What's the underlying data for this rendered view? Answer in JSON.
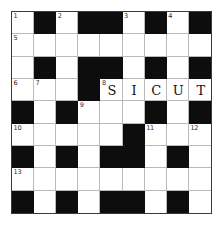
{
  "puzzle": {
    "type": "crossword-grid",
    "rows": 9,
    "columns": 9,
    "block_color": "#0d0d0d",
    "cell_color": "#ffffff",
    "grid_line_color": "#b9b9b9",
    "border_color": "#3a3a3a",
    "number_color": "#2b2b2b",
    "letter_color": "#111111",
    "filled_answer": "SICUT",
    "clue_numbers": [
      1,
      2,
      3,
      4,
      5,
      6,
      7,
      8,
      9,
      10,
      11,
      12,
      13
    ],
    "cells": [
      [
        {
          "block": false,
          "number": "1",
          "letter": ""
        },
        {
          "block": true,
          "number": "",
          "letter": ""
        },
        {
          "block": false,
          "number": "2",
          "letter": ""
        },
        {
          "block": true,
          "number": "",
          "letter": ""
        },
        {
          "block": true,
          "number": "",
          "letter": ""
        },
        {
          "block": false,
          "number": "3",
          "letter": ""
        },
        {
          "block": true,
          "number": "",
          "letter": ""
        },
        {
          "block": false,
          "number": "4",
          "letter": ""
        },
        {
          "block": true,
          "number": "",
          "letter": ""
        }
      ],
      [
        {
          "block": false,
          "number": "5",
          "letter": ""
        },
        {
          "block": false,
          "number": "",
          "letter": ""
        },
        {
          "block": false,
          "number": "",
          "letter": ""
        },
        {
          "block": false,
          "number": "",
          "letter": ""
        },
        {
          "block": false,
          "number": "",
          "letter": ""
        },
        {
          "block": false,
          "number": "",
          "letter": ""
        },
        {
          "block": false,
          "number": "",
          "letter": ""
        },
        {
          "block": false,
          "number": "",
          "letter": ""
        },
        {
          "block": false,
          "number": "",
          "letter": ""
        }
      ],
      [
        {
          "block": false,
          "number": "",
          "letter": ""
        },
        {
          "block": true,
          "number": "",
          "letter": ""
        },
        {
          "block": false,
          "number": "",
          "letter": ""
        },
        {
          "block": true,
          "number": "",
          "letter": ""
        },
        {
          "block": true,
          "number": "",
          "letter": ""
        },
        {
          "block": false,
          "number": "",
          "letter": ""
        },
        {
          "block": true,
          "number": "",
          "letter": ""
        },
        {
          "block": false,
          "number": "",
          "letter": ""
        },
        {
          "block": true,
          "number": "",
          "letter": ""
        }
      ],
      [
        {
          "block": false,
          "number": "6",
          "letter": ""
        },
        {
          "block": false,
          "number": "7",
          "letter": ""
        },
        {
          "block": false,
          "number": "",
          "letter": ""
        },
        {
          "block": true,
          "number": "",
          "letter": ""
        },
        {
          "block": false,
          "number": "8",
          "letter": "S"
        },
        {
          "block": false,
          "number": "",
          "letter": "I"
        },
        {
          "block": false,
          "number": "",
          "letter": "C"
        },
        {
          "block": false,
          "number": "",
          "letter": "U"
        },
        {
          "block": false,
          "number": "",
          "letter": "T"
        }
      ],
      [
        {
          "block": true,
          "number": "",
          "letter": ""
        },
        {
          "block": false,
          "number": "",
          "letter": ""
        },
        {
          "block": true,
          "number": "",
          "letter": ""
        },
        {
          "block": false,
          "number": "9",
          "letter": ""
        },
        {
          "block": false,
          "number": "",
          "letter": ""
        },
        {
          "block": false,
          "number": "",
          "letter": ""
        },
        {
          "block": true,
          "number": "",
          "letter": ""
        },
        {
          "block": false,
          "number": "",
          "letter": ""
        },
        {
          "block": true,
          "number": "",
          "letter": ""
        }
      ],
      [
        {
          "block": false,
          "number": "10",
          "letter": ""
        },
        {
          "block": false,
          "number": "",
          "letter": ""
        },
        {
          "block": false,
          "number": "",
          "letter": ""
        },
        {
          "block": false,
          "number": "",
          "letter": ""
        },
        {
          "block": false,
          "number": "",
          "letter": ""
        },
        {
          "block": true,
          "number": "",
          "letter": ""
        },
        {
          "block": false,
          "number": "11",
          "letter": ""
        },
        {
          "block": false,
          "number": "",
          "letter": ""
        },
        {
          "block": false,
          "number": "12",
          "letter": ""
        }
      ],
      [
        {
          "block": true,
          "number": "",
          "letter": ""
        },
        {
          "block": false,
          "number": "",
          "letter": ""
        },
        {
          "block": true,
          "number": "",
          "letter": ""
        },
        {
          "block": false,
          "number": "",
          "letter": ""
        },
        {
          "block": true,
          "number": "",
          "letter": ""
        },
        {
          "block": true,
          "number": "",
          "letter": ""
        },
        {
          "block": false,
          "number": "",
          "letter": ""
        },
        {
          "block": true,
          "number": "",
          "letter": ""
        },
        {
          "block": false,
          "number": "",
          "letter": ""
        }
      ],
      [
        {
          "block": false,
          "number": "13",
          "letter": ""
        },
        {
          "block": false,
          "number": "",
          "letter": ""
        },
        {
          "block": false,
          "number": "",
          "letter": ""
        },
        {
          "block": false,
          "number": "",
          "letter": ""
        },
        {
          "block": false,
          "number": "",
          "letter": ""
        },
        {
          "block": false,
          "number": "",
          "letter": ""
        },
        {
          "block": false,
          "number": "",
          "letter": ""
        },
        {
          "block": false,
          "number": "",
          "letter": ""
        },
        {
          "block": false,
          "number": "",
          "letter": ""
        }
      ],
      [
        {
          "block": true,
          "number": "",
          "letter": ""
        },
        {
          "block": false,
          "number": "",
          "letter": ""
        },
        {
          "block": true,
          "number": "",
          "letter": ""
        },
        {
          "block": false,
          "number": "",
          "letter": ""
        },
        {
          "block": true,
          "number": "",
          "letter": ""
        },
        {
          "block": true,
          "number": "",
          "letter": ""
        },
        {
          "block": false,
          "number": "",
          "letter": ""
        },
        {
          "block": true,
          "number": "",
          "letter": ""
        },
        {
          "block": false,
          "number": "",
          "letter": ""
        }
      ]
    ]
  }
}
